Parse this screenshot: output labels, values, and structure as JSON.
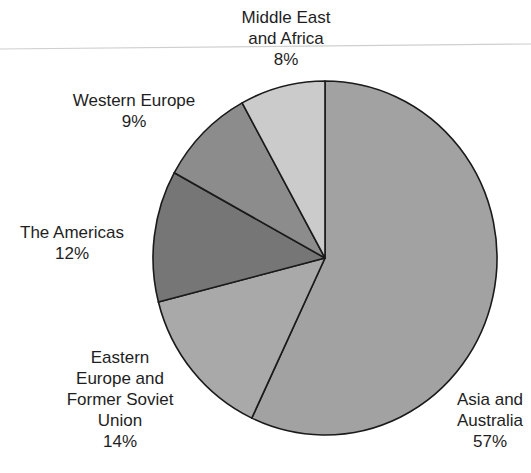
{
  "chart_data": {
    "type": "pie",
    "title": "",
    "start_angle_deg": 0,
    "direction": "clockwise",
    "slices": [
      {
        "label": "Asia and Australia",
        "value": 57,
        "display": "57%",
        "color": "#a2a2a2"
      },
      {
        "label": "Eastern Europe and Former Soviet Union",
        "value": 14,
        "display": "14%",
        "color": "#a9a9a9"
      },
      {
        "label": "The Americas",
        "value": 12,
        "display": "12%",
        "color": "#767676"
      },
      {
        "label": "Western Europe",
        "value": 9,
        "display": "9%",
        "color": "#8c8c8c"
      },
      {
        "label": "Middle East and Africa",
        "value": 8,
        "display": "8%",
        "color": "#cbcbcb"
      }
    ],
    "units": "%"
  },
  "labels": {
    "middle_east": {
      "line1": "Middle East",
      "line2": "and Africa",
      "pct": "8%"
    },
    "western_europe": {
      "line1": "Western Europe",
      "pct": "9%"
    },
    "americas": {
      "line1": "The Americas",
      "pct": "12%"
    },
    "eastern_europe": {
      "line1": "Eastern",
      "line2": "Europe and",
      "line3": "Former Soviet",
      "line4": "Union",
      "pct": "14%"
    },
    "asia": {
      "line1": "Asia and",
      "line2": "Australia",
      "pct": "57%"
    }
  },
  "style": {
    "outline": "#1a1a1a",
    "rule_color": "#cfcfcf"
  }
}
